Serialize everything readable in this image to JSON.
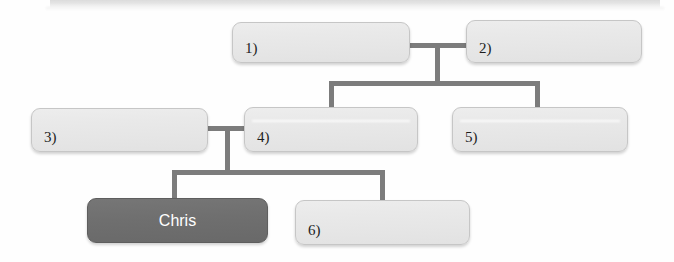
{
  "diagram": {
    "type": "family-tree-genogram",
    "highlight_color": "#6e6e6e",
    "box_color": "#e8e8e8",
    "line_color": "#7c7c7c",
    "nodes": [
      {
        "id": "n1",
        "label": "1)",
        "style": "light",
        "x": 232,
        "y": 22,
        "w": 178,
        "h": 41
      },
      {
        "id": "n2",
        "label": "2)",
        "style": "light",
        "x": 466,
        "y": 20,
        "w": 176,
        "h": 43
      },
      {
        "id": "n3",
        "label": "3)",
        "style": "light",
        "x": 31,
        "y": 108,
        "w": 177,
        "h": 44
      },
      {
        "id": "n4",
        "label": "4)",
        "style": "light",
        "x": 244,
        "y": 107,
        "w": 174,
        "h": 45
      },
      {
        "id": "n5",
        "label": "5)",
        "style": "light",
        "x": 452,
        "y": 107,
        "w": 176,
        "h": 45
      },
      {
        "id": "n6",
        "label": "Chris",
        "style": "dark",
        "x": 87,
        "y": 198,
        "w": 181,
        "h": 45
      },
      {
        "id": "n7",
        "label": "6)",
        "style": "light",
        "x": 295,
        "y": 200,
        "w": 175,
        "h": 45
      }
    ],
    "connectors": [
      {
        "id": "c-spouse-top",
        "orient": "h",
        "x": 406,
        "y": 43,
        "len": 62
      },
      {
        "id": "c-drop-top",
        "orient": "v",
        "x": 435,
        "y": 43,
        "len": 42
      },
      {
        "id": "c-sibling-bar",
        "orient": "h",
        "x": 329,
        "y": 81,
        "len": 211
      },
      {
        "id": "c-drop-n4",
        "orient": "v",
        "x": 329,
        "y": 81,
        "len": 28
      },
      {
        "id": "c-drop-n5",
        "orient": "v",
        "x": 535,
        "y": 81,
        "len": 28
      },
      {
        "id": "c-spouse-mid",
        "orient": "h",
        "x": 205,
        "y": 126,
        "len": 42
      },
      {
        "id": "c-drop-mid",
        "orient": "v",
        "x": 225,
        "y": 126,
        "len": 46
      },
      {
        "id": "c-sibling-bar2",
        "orient": "h",
        "x": 172,
        "y": 170,
        "len": 213
      },
      {
        "id": "c-drop-chris",
        "orient": "v",
        "x": 172,
        "y": 170,
        "len": 30
      },
      {
        "id": "c-drop-n6",
        "orient": "v",
        "x": 380,
        "y": 170,
        "len": 32
      }
    ]
  }
}
